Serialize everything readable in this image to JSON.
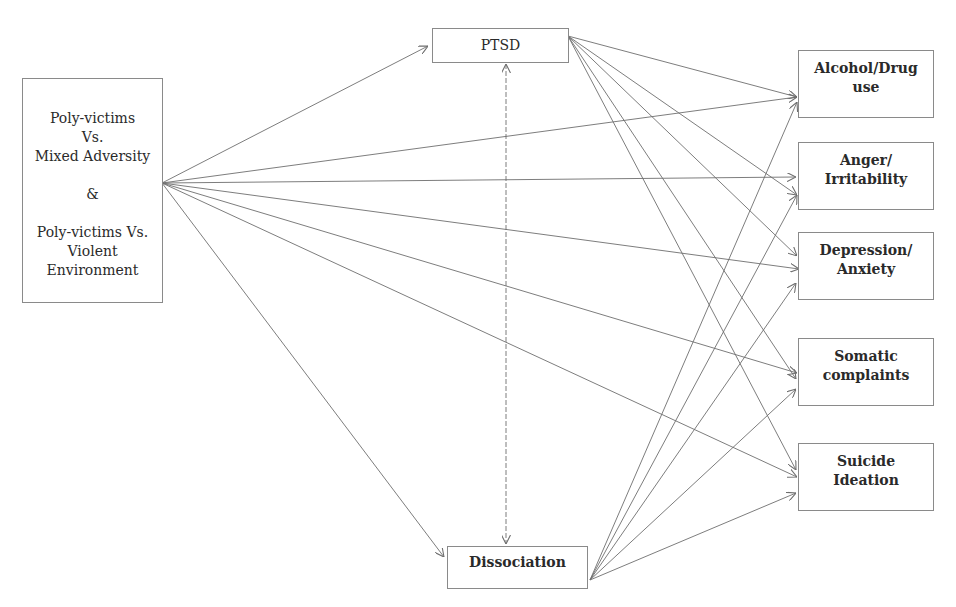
{
  "diagram": {
    "type": "path-model",
    "nodes": {
      "predictor": {
        "lines": [
          "Poly-victims",
          "Vs.",
          "Mixed Adversity",
          "",
          "&",
          "",
          "Poly-victims Vs.",
          "Violent",
          "Environment"
        ]
      },
      "ptsd": {
        "label": "PTSD"
      },
      "dissociation": {
        "label": "Dissociation"
      },
      "outcomes": [
        {
          "id": "alcohol",
          "lines": [
            "Alcohol/Drug",
            "use"
          ]
        },
        {
          "id": "anger",
          "lines": [
            "Anger/",
            "Irritability"
          ]
        },
        {
          "id": "depression",
          "lines": [
            "Depression/",
            "Anxiety"
          ]
        },
        {
          "id": "somatic",
          "lines": [
            "Somatic",
            "complaints"
          ]
        },
        {
          "id": "suicide",
          "lines": [
            "Suicide",
            "Ideation"
          ]
        }
      ]
    },
    "edges": [
      {
        "from": "predictor",
        "to": "ptsd"
      },
      {
        "from": "predictor",
        "to": "dissociation"
      },
      {
        "from": "predictor",
        "to": "alcohol"
      },
      {
        "from": "predictor",
        "to": "anger"
      },
      {
        "from": "predictor",
        "to": "depression"
      },
      {
        "from": "predictor",
        "to": "somatic"
      },
      {
        "from": "predictor",
        "to": "suicide"
      },
      {
        "from": "ptsd",
        "to": "dissociation",
        "bidirectional": true
      },
      {
        "from": "ptsd",
        "to": "alcohol"
      },
      {
        "from": "ptsd",
        "to": "anger"
      },
      {
        "from": "ptsd",
        "to": "depression"
      },
      {
        "from": "ptsd",
        "to": "somatic"
      },
      {
        "from": "ptsd",
        "to": "suicide"
      },
      {
        "from": "dissociation",
        "to": "alcohol"
      },
      {
        "from": "dissociation",
        "to": "anger"
      },
      {
        "from": "dissociation",
        "to": "depression"
      },
      {
        "from": "dissociation",
        "to": "somatic"
      },
      {
        "from": "dissociation",
        "to": "suicide"
      }
    ],
    "colors": {
      "line": "#6e6e6e",
      "border": "#8a8a8a",
      "text": "#2a2a2a"
    }
  }
}
